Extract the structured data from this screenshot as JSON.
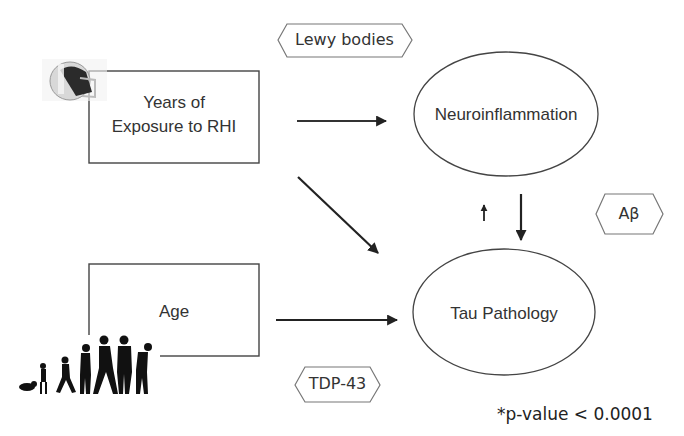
{
  "diagram": {
    "nodes": {
      "rhi": {
        "line1": "Years of",
        "line2": "Exposure to RHI",
        "shape": "rectangle",
        "icon": "football-helmet-icon"
      },
      "age": {
        "label": "Age",
        "shape": "rectangle",
        "icon": "human-aging-silhouettes-icon"
      },
      "neuro": {
        "label": "Neuroinflammation",
        "shape": "ellipse"
      },
      "tau": {
        "label": "Tau Pathology",
        "shape": "ellipse"
      }
    },
    "copathologies": {
      "lewy": {
        "label": "Lewy bodies",
        "shape": "hexagon"
      },
      "abeta": {
        "label": "Aβ",
        "shape": "hexagon"
      },
      "tdp": {
        "label": "TDP-43",
        "shape": "hexagon"
      }
    },
    "edges": [
      {
        "from": "Years of Exposure to RHI",
        "to": "Neuroinflammation"
      },
      {
        "from": "Years of Exposure to RHI",
        "to": "Tau Pathology"
      },
      {
        "from": "Age",
        "to": "Tau Pathology"
      },
      {
        "from": "Neuroinflammation",
        "to": "Tau Pathology"
      },
      {
        "from": "Tau Pathology",
        "to": "Neuroinflammation",
        "style": "small"
      }
    ],
    "footnote": "*p-value < 0.0001",
    "colors": {
      "line": "#333333",
      "background": "#ffffff"
    }
  }
}
